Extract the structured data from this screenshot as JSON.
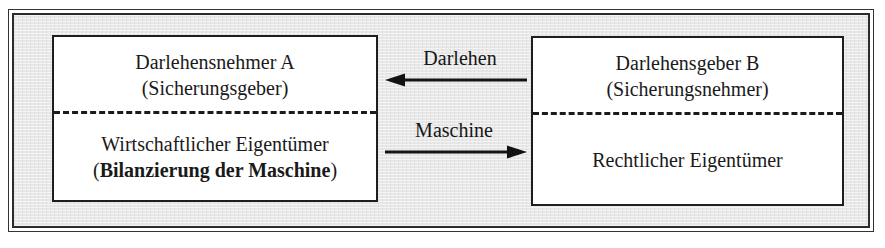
{
  "figure": {
    "background_color": "#e8e8e8",
    "frame_color": "#2b2b2b",
    "box_fill": "#ffffff",
    "box_border_color": "#1e1e1e",
    "text_color": "#1a1a1a"
  },
  "left_entity": {
    "name": "borrower",
    "top": {
      "line1": "Darlehensnehmer A",
      "line2": "(Sicherungsgeber)"
    },
    "bottom": {
      "line1": "Wirtschaftlicher Eigentümer",
      "paren_open": "(",
      "emphasis": "Bilanzierung der Maschine",
      "paren_close": ")"
    }
  },
  "right_entity": {
    "name": "lender",
    "top": {
      "line1": "Darlehensgeber B",
      "line2": "(Sicherungsnehmer)"
    },
    "bottom": {
      "line1": "Rechtlicher Eigentümer"
    }
  },
  "flows": [
    {
      "label": "Darlehen",
      "direction": "right-to-left",
      "arrow_icon": "arrow-left-icon"
    },
    {
      "label": "Maschine",
      "direction": "left-to-right",
      "arrow_icon": "arrow-right-icon"
    }
  ]
}
